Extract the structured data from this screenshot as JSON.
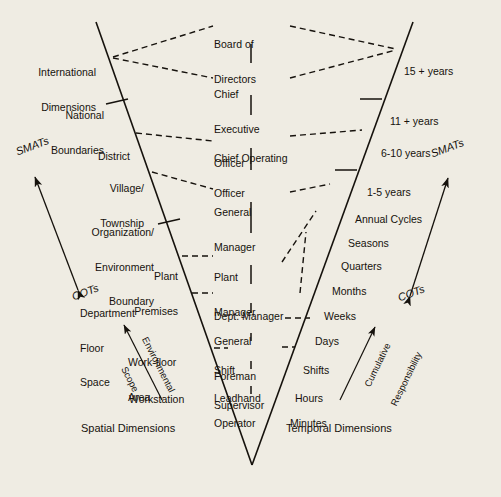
{
  "figure": {
    "background_color": "#efece3",
    "ink_color": "#16120d",
    "caption_left": "Spatial Dimensions",
    "caption_right": "Temporal Dimensions"
  },
  "axes": {
    "left_axis_name": "spatial-axis-line",
    "right_axis_name": "temporal-axis-line",
    "left_ticks_at": [
      "National Boundaries",
      "Organization/ Environment Boundary"
    ],
    "right_ticks_at": [
      "11 + years",
      "1-5 years"
    ]
  },
  "spatial": {
    "items": [
      {
        "line1": "International",
        "line2": "Dimensions",
        "line3": ""
      },
      {
        "line1": "National",
        "line2": "Boundaries",
        "line3": ""
      },
      {
        "line1": "District",
        "line2": "",
        "line3": ""
      },
      {
        "line1": "Village/",
        "line2": "Township",
        "line3": ""
      },
      {
        "line1": "Organization/",
        "line2": "Environment",
        "line3": "Boundary"
      },
      {
        "line1": "Plant",
        "line2": "Premises",
        "line3": ""
      },
      {
        "line1": "Department",
        "line2": "Floor",
        "line3": "Space"
      },
      {
        "line1": "Work-floor",
        "line2": "Area",
        "line3": ""
      },
      {
        "line1": "Workstation",
        "line2": "",
        "line3": ""
      }
    ]
  },
  "organization": {
    "items": [
      {
        "line1": "Board of",
        "line2": "Directors",
        "line3": ""
      },
      {
        "line1": "Chief",
        "line2": "Executive",
        "line3": "Officer"
      },
      {
        "line1": "Chief Operating",
        "line2": "Officer",
        "line3": ""
      },
      {
        "line1": "General",
        "line2": "Manager",
        "line3": ""
      },
      {
        "line1": "Plant",
        "line2": "Manager",
        "line3": ""
      },
      {
        "line1": "Dept. Manager",
        "line2": "",
        "line3": ""
      },
      {
        "line1": "General",
        "line2": "Foreman",
        "line3": ""
      },
      {
        "line1": "Shift",
        "line2": "Supervisor",
        "line3": ""
      },
      {
        "line1": "Leadhand",
        "line2": "",
        "line3": ""
      },
      {
        "line1": "Operator",
        "line2": "",
        "line3": ""
      }
    ]
  },
  "temporal": {
    "items": [
      {
        "label": "15 + years"
      },
      {
        "label": "11 + years"
      },
      {
        "label": "6-10 years"
      },
      {
        "label": "1-5 years"
      },
      {
        "label": "Annual Cycles"
      },
      {
        "label": "Seasons"
      },
      {
        "label": "Quarters"
      },
      {
        "label": "Months"
      },
      {
        "label": "Weeks"
      },
      {
        "label": "Days"
      },
      {
        "label": "Shifts"
      },
      {
        "label": "Hours"
      },
      {
        "label": "Minutes"
      }
    ]
  },
  "arrows": {
    "left": {
      "top_label": "SMATs",
      "bottom_label": "COTs"
    },
    "right": {
      "top_label": "SMATs",
      "bottom_label": "COTs"
    },
    "left_inner": {
      "line1": "Environmental",
      "line2": "Scope"
    },
    "right_inner": {
      "line1": "Cumulative",
      "line2": "Responsibility"
    }
  }
}
